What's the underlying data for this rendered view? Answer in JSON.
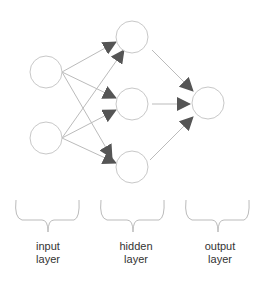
{
  "diagram": {
    "colors": {
      "node_stroke": "#c8c8c8",
      "edge": "#b8b8b8",
      "arrow": "#555555",
      "brace": "#bbbbbb",
      "text": "#333333"
    },
    "layers": [
      {
        "id": "input",
        "label_line1": "input",
        "label_line2": "layer",
        "nodes": [
          [
            46,
            72
          ],
          [
            46,
            138
          ]
        ]
      },
      {
        "id": "hidden",
        "label_line1": "hidden",
        "label_line2": "layer",
        "nodes": [
          [
            132,
            37
          ],
          [
            132,
            104
          ],
          [
            132,
            167
          ]
        ]
      },
      {
        "id": "output",
        "label_line1": "output",
        "label_line2": "layer",
        "nodes": [
          [
            208,
            103
          ]
        ]
      }
    ],
    "node_radius": 16
  }
}
